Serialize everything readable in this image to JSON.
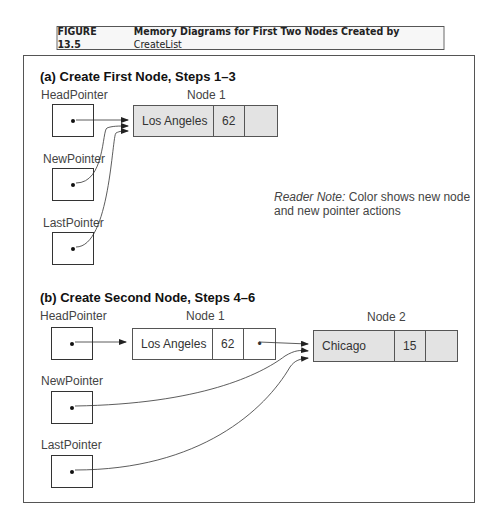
{
  "figure": {
    "number": "FIGURE 13.5",
    "title": "Memory Diagrams for First Two Nodes Created by",
    "title_code": "CreateList"
  },
  "panel_a": {
    "title": "(a) Create First Node, Steps 1–3",
    "pointers": [
      {
        "label": "HeadPointer"
      },
      {
        "label": "NewPointer"
      },
      {
        "label": "LastPointer"
      }
    ],
    "node1": {
      "label": "Node 1",
      "city": "Los Angeles",
      "value": "62",
      "next": ""
    },
    "note": {
      "lead": "Reader Note:",
      "text_line1": "Color shows new node",
      "text_line2": "and new pointer actions"
    }
  },
  "panel_b": {
    "title": "(b) Create Second Node, Steps 4–6",
    "pointers": [
      {
        "label": "HeadPointer"
      },
      {
        "label": "NewPointer"
      },
      {
        "label": "LastPointer"
      }
    ],
    "node1": {
      "label": "Node 1",
      "city": "Los Angeles",
      "value": "62",
      "next": "•"
    },
    "node2": {
      "label": "Node 2",
      "city": "Chicago",
      "value": "15",
      "next": ""
    }
  },
  "colors": {
    "new_node_fill": "#e3e3e3",
    "border": "#555555"
  }
}
